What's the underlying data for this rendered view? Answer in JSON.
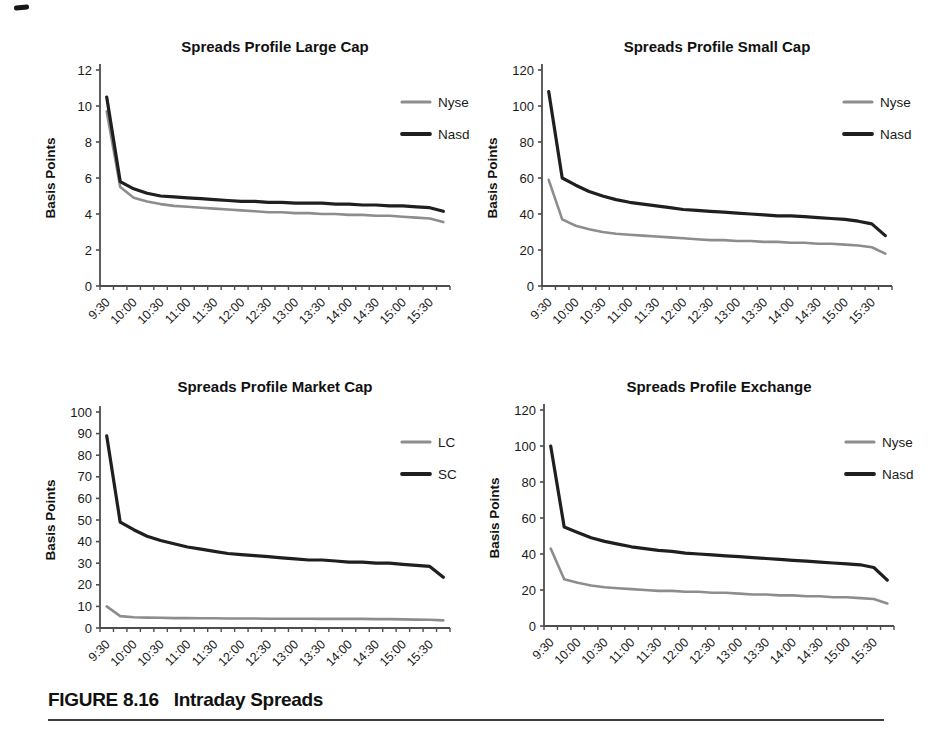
{
  "page": {
    "background": "#ffffff",
    "figure_label": "FIGURE 8.16",
    "figure_title": "Intraday Spreads"
  },
  "colors": {
    "series_gray": "#8d8d8d",
    "series_black": "#1f1f1f",
    "axis": "#4d4d4d",
    "text": "#1a1a1a"
  },
  "chart_data": [
    {
      "type": "line",
      "title": "Spreads Profile Large Cap",
      "ylabel": "Basis Points",
      "ylim": [
        0,
        12
      ],
      "ytick_step": 2,
      "grid": false,
      "legend_position": "right-inside",
      "x_labels": [
        "9:30",
        "10:00",
        "10:30",
        "11:00",
        "11:30",
        "12:00",
        "12:30",
        "13:00",
        "13:30",
        "14:00",
        "14:30",
        "15:00",
        "15:30"
      ],
      "x_minor_tick_minutes": 15,
      "series": [
        {
          "name": "Nyse",
          "color": "#8d8d8d",
          "width": 2.6,
          "values": [
            9.7,
            5.5,
            4.9,
            4.7,
            4.55,
            4.45,
            4.4,
            4.35,
            4.3,
            4.25,
            4.2,
            4.15,
            4.1,
            4.1,
            4.05,
            4.05,
            4.0,
            4.0,
            3.95,
            3.95,
            3.9,
            3.9,
            3.85,
            3.8,
            3.75,
            3.55
          ]
        },
        {
          "name": "Nasd",
          "color": "#1f1f1f",
          "width": 3.2,
          "values": [
            10.5,
            5.8,
            5.4,
            5.15,
            5.0,
            4.95,
            4.9,
            4.85,
            4.8,
            4.75,
            4.7,
            4.7,
            4.65,
            4.65,
            4.6,
            4.6,
            4.6,
            4.55,
            4.55,
            4.5,
            4.5,
            4.45,
            4.45,
            4.4,
            4.35,
            4.15
          ]
        }
      ]
    },
    {
      "type": "line",
      "title": "Spreads Profile Small Cap",
      "ylabel": "Basis Points",
      "ylim": [
        0,
        120
      ],
      "ytick_step": 20,
      "grid": false,
      "legend_position": "right-inside",
      "x_labels": [
        "9:30",
        "10:00",
        "10:30",
        "11:00",
        "11:30",
        "12:00",
        "12:30",
        "13:00",
        "13:30",
        "14:00",
        "14:30",
        "15:00",
        "15:30"
      ],
      "x_minor_tick_minutes": 15,
      "series": [
        {
          "name": "Nyse",
          "color": "#8d8d8d",
          "width": 2.6,
          "values": [
            59,
            37,
            33.5,
            31.5,
            30,
            29,
            28.5,
            28,
            27.5,
            27,
            26.5,
            26,
            25.5,
            25.5,
            25,
            25,
            24.5,
            24.5,
            24,
            24,
            23.5,
            23.5,
            23,
            22.5,
            21.5,
            18
          ]
        },
        {
          "name": "Nasd",
          "color": "#1f1f1f",
          "width": 3.2,
          "values": [
            108,
            60,
            56,
            52.5,
            50,
            48,
            46.5,
            45.5,
            44.5,
            43.5,
            42.5,
            42,
            41.5,
            41,
            40.5,
            40,
            39.5,
            39,
            39,
            38.5,
            38,
            37.5,
            37,
            36,
            34.5,
            28
          ]
        }
      ]
    },
    {
      "type": "line",
      "title": "Spreads Profile Market Cap",
      "ylabel": "Basis Points",
      "ylim": [
        0,
        100
      ],
      "ytick_step": 10,
      "grid": false,
      "legend_position": "right-inside",
      "x_labels": [
        "9:30",
        "10:00",
        "10:30",
        "11:00",
        "11:30",
        "12:00",
        "12:30",
        "13:00",
        "13:30",
        "14:00",
        "14:30",
        "15:00",
        "15:30"
      ],
      "x_minor_tick_minutes": 15,
      "series": [
        {
          "name": "LC",
          "color": "#8d8d8d",
          "width": 2.6,
          "values": [
            10,
            5.5,
            5.0,
            4.8,
            4.7,
            4.6,
            4.6,
            4.5,
            4.5,
            4.4,
            4.4,
            4.4,
            4.3,
            4.3,
            4.3,
            4.3,
            4.2,
            4.2,
            4.2,
            4.2,
            4.1,
            4.1,
            4.0,
            3.9,
            3.8,
            3.5
          ]
        },
        {
          "name": "SC",
          "color": "#1f1f1f",
          "width": 3.2,
          "values": [
            89,
            49,
            45.5,
            42.5,
            40.5,
            39,
            37.5,
            36.5,
            35.5,
            34.5,
            34,
            33.5,
            33,
            32.5,
            32,
            31.5,
            31.5,
            31,
            30.5,
            30.5,
            30,
            30,
            29.5,
            29,
            28.5,
            23.5
          ]
        }
      ]
    },
    {
      "type": "line",
      "title": "Spreads Profile Exchange",
      "ylabel": "Basis Points",
      "ylim": [
        0,
        120
      ],
      "ytick_step": 20,
      "grid": false,
      "legend_position": "right-inside",
      "x_labels": [
        "9:30",
        "10:00",
        "10:30",
        "11:00",
        "11:30",
        "12:00",
        "12:30",
        "13:00",
        "13:30",
        "14:00",
        "14:30",
        "15:00",
        "15:30"
      ],
      "x_minor_tick_minutes": 15,
      "series": [
        {
          "name": "Nyse",
          "color": "#8d8d8d",
          "width": 2.6,
          "values": [
            43,
            26,
            24,
            22.5,
            21.5,
            21,
            20.5,
            20,
            19.5,
            19.5,
            19,
            19,
            18.5,
            18.5,
            18,
            17.5,
            17.5,
            17,
            17,
            16.5,
            16.5,
            16,
            16,
            15.5,
            15,
            12.5
          ]
        },
        {
          "name": "Nasd",
          "color": "#1f1f1f",
          "width": 3.2,
          "values": [
            100,
            55,
            52,
            49,
            47,
            45.5,
            44,
            43,
            42,
            41.5,
            40.5,
            40,
            39.5,
            39,
            38.5,
            38,
            37.5,
            37,
            36.5,
            36,
            35.5,
            35,
            34.5,
            34,
            32.5,
            25.5
          ]
        }
      ]
    }
  ]
}
